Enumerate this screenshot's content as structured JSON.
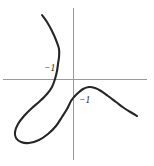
{
  "figure": {
    "width": 154,
    "height": 166,
    "background_color": "#ffffff",
    "axis_color": "#9a9a9a",
    "curve_color": "#262626"
  },
  "chart_data": {
    "type": "line",
    "title": "",
    "xlabel": "",
    "ylabel": "",
    "grid": false,
    "legend": null,
    "axes": {
      "origin_px": [
        73,
        79
      ],
      "x_axis_px": {
        "y": 79,
        "x_start": 3,
        "x_end": 147
      },
      "y_axis_px": {
        "x": 73,
        "y_start": 8,
        "y_end": 160
      },
      "xlim": [
        -4.4,
        4.6
      ],
      "ylim": [
        -5.2,
        2.2
      ],
      "units_per_px": 0.0625
    },
    "annotations": [
      {
        "name": "x-intercept-label",
        "text": "−1",
        "value": -1,
        "axis": "x",
        "at_px": [
          57,
          79
        ],
        "label_px": [
          44,
          64
        ]
      },
      {
        "name": "y-intercept-label",
        "text": "−1",
        "value": -1,
        "axis": "y",
        "at_px": [
          73,
          103
        ],
        "label_px": [
          79,
          96
        ]
      }
    ],
    "series": [
      {
        "name": "cubic-curve-with-loop",
        "description": "Self-intersecting cubic curve: upper branch descends from the upper left, crosses the x-axis at x = -1, sweeps into a large loop through the third quadrant, returns through the node and rises across the y-axis at y = -1, peaks in the fourth quadrant and falls to the lower right.",
        "closed": false,
        "points_px": [
          [
            42,
            15
          ],
          [
            47,
            22
          ],
          [
            52,
            31
          ],
          [
            56,
            40
          ],
          [
            59,
            49
          ],
          [
            59,
            57
          ],
          [
            58,
            64
          ],
          [
            57,
            71
          ],
          [
            55,
            79
          ],
          [
            52,
            87
          ],
          [
            47,
            94
          ],
          [
            40,
            101
          ],
          [
            32,
            108
          ],
          [
            24,
            116
          ],
          [
            18,
            124
          ],
          [
            15,
            132
          ],
          [
            16,
            138
          ],
          [
            21,
            142
          ],
          [
            29,
            143
          ],
          [
            39,
            140
          ],
          [
            48,
            134
          ],
          [
            56,
            126
          ],
          [
            62,
            117
          ],
          [
            67,
            109
          ],
          [
            71,
            101
          ],
          [
            74,
            97
          ],
          [
            78,
            93
          ],
          [
            83,
            89
          ],
          [
            89,
            87
          ],
          [
            95,
            88
          ],
          [
            101,
            91
          ],
          [
            108,
            96
          ],
          [
            116,
            102
          ],
          [
            124,
            108
          ],
          [
            132,
            113
          ],
          [
            137,
            116
          ]
        ]
      }
    ]
  }
}
